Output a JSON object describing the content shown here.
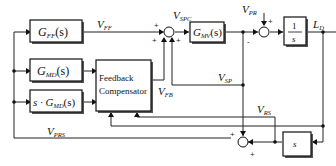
{
  "diagram": {
    "blocks": {
      "gff": {
        "main": "G",
        "sub": "FF",
        "arg": "(s)"
      },
      "gmd": {
        "main": "G",
        "sub": "MD",
        "arg": "(s)"
      },
      "sgmd": {
        "prefix": "s · ",
        "main": "G",
        "sub": "MD",
        "arg": "(s)"
      },
      "compensator": {
        "line1": "Feedback",
        "line2": "Compensator"
      },
      "gmv": {
        "main": "G",
        "sub": "MV",
        "arg": "(s)"
      },
      "integrator": {
        "num": "1",
        "den": "s"
      },
      "derivative": {
        "label": "s"
      }
    },
    "signals": {
      "vff": {
        "main": "V",
        "sub": "FF"
      },
      "vfb": {
        "main": "V",
        "sub": "FB"
      },
      "vspc": {
        "main": "V",
        "sub": "SPC"
      },
      "vsp": {
        "main": "V",
        "sub": "SP"
      },
      "vpr": {
        "main": "V",
        "sub": "PR"
      },
      "ld": {
        "main": "L",
        "sub": "D"
      },
      "vrs": {
        "main": "V",
        "sub": "RS"
      },
      "vprs": {
        "main": "V",
        "sub": "PRS"
      }
    },
    "signs": {
      "sum1_left": "+",
      "sum1_bottom_left": "+",
      "sum1_bottom_right": "+",
      "sum2_top": "+",
      "sum2_left": "-",
      "sum3_top": "+",
      "sum3_bottom": "+"
    }
  }
}
